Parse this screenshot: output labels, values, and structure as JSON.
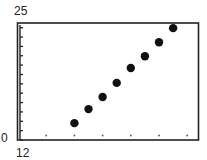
{
  "chart_data": {
    "type": "scatter",
    "title": "",
    "xlabel": "",
    "ylabel": "",
    "xlim": [
      12,
      18.4
    ],
    "ylim": [
      0,
      25
    ],
    "x_tick_step": 1,
    "y_tick_step": 2,
    "grid": false,
    "legend": null,
    "axis_labels": {
      "y_max": "25",
      "y_min": "0",
      "x_min": "12"
    },
    "series": [
      {
        "name": "data",
        "color": "#111111",
        "points": [
          {
            "x": 14.0,
            "y": 3.6
          },
          {
            "x": 14.5,
            "y": 6.6
          },
          {
            "x": 15.0,
            "y": 9.2
          },
          {
            "x": 15.5,
            "y": 12.2
          },
          {
            "x": 16.0,
            "y": 15.4
          },
          {
            "x": 16.5,
            "y": 17.9
          },
          {
            "x": 17.0,
            "y": 20.9
          },
          {
            "x": 17.5,
            "y": 23.9
          }
        ]
      }
    ]
  }
}
